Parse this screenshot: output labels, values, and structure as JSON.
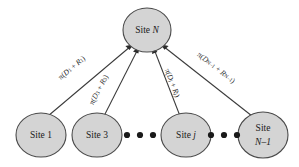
{
  "figure": {
    "type": "star-topology-graph",
    "background_color": "#ffffff",
    "node_fill": "#d4d4d4",
    "node_stroke": "#4a4a4a",
    "edge_color": "#3a3a3a"
  },
  "hub_node": {
    "id": "site-n",
    "label_prefix": "Site ",
    "label_symbol": "N"
  },
  "leaf_nodes": [
    {
      "id": "site-1",
      "label_prefix": "Site ",
      "label_symbol": "1",
      "two_line": false,
      "line1": "",
      "line2": ""
    },
    {
      "id": "site-3",
      "label_prefix": "Site ",
      "label_symbol": "3",
      "two_line": false,
      "line1": "",
      "line2": ""
    },
    {
      "id": "site-j",
      "label_prefix": "Site ",
      "label_symbol": "j",
      "two_line": false,
      "line1": "",
      "line2": ""
    },
    {
      "id": "site-n-1",
      "label_prefix": "",
      "label_symbol": "",
      "two_line": true,
      "line1": "Site",
      "line2": "N–1"
    }
  ],
  "edge_labels": [
    {
      "id": "edge-label-1",
      "pi": "π(",
      "d": "D",
      "d_sub": "1",
      "plus": " + ",
      "r": "R",
      "r_sub": "1",
      "close": ")"
    },
    {
      "id": "edge-label-3",
      "pi": "π(",
      "d": "D",
      "d_sub": "3",
      "plus": " + ",
      "r": "R",
      "r_sub": "3",
      "close": ")"
    },
    {
      "id": "edge-label-j",
      "pi": "π(",
      "d": "D",
      "d_sub": "j",
      "plus": " + ",
      "r": "R",
      "r_sub": "j",
      "close": ")"
    },
    {
      "id": "edge-label-n-1",
      "pi": "π(",
      "d": "D",
      "d_sub": "N–1",
      "plus": " + ",
      "r": "R",
      "r_sub": "N–1",
      "close": ")"
    }
  ],
  "ellipsis_groups": [
    {
      "id": "ellipsis-left",
      "dot_count": 3
    },
    {
      "id": "ellipsis-right",
      "dot_count": 3
    }
  ]
}
